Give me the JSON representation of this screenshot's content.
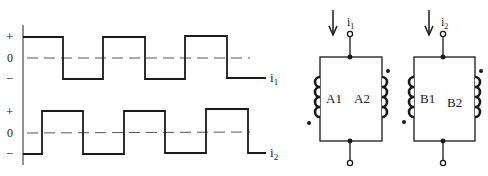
{
  "waveforms": {
    "level_labels": {
      "plus": "+",
      "zero": "0",
      "minus": "−"
    },
    "top": {
      "name": "i",
      "subscript": "1"
    },
    "bottom": {
      "name": "i",
      "subscript": "2"
    }
  },
  "circuits": [
    {
      "current": "i",
      "subscript": "1",
      "coil_left": "A1",
      "coil_right": "A2"
    },
    {
      "current": "i",
      "subscript": "2",
      "coil_left": "B1",
      "coil_right": "B2"
    }
  ],
  "colors": {
    "line": "#1a1a1a",
    "dashed": "#555555"
  }
}
